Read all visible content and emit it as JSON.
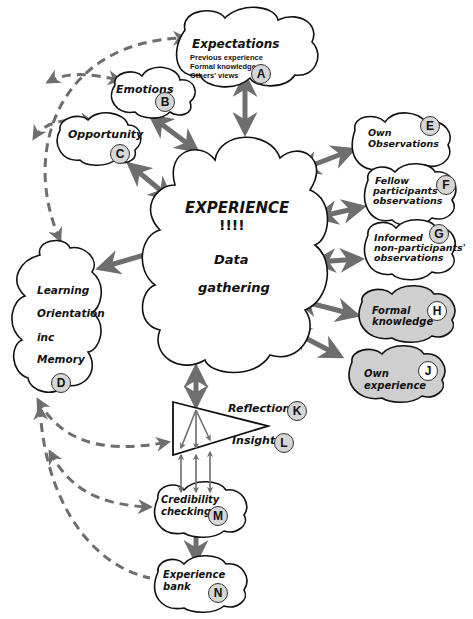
{
  "diagram": {
    "title_cut": "",
    "center": {
      "title": "EXPERIENCE",
      "exclaim": "!!!!",
      "line1": "Data",
      "line2": "gathering"
    },
    "nodes": {
      "A": {
        "badge": "A",
        "title": "Expectations",
        "lines": [
          "Previous experience",
          "Formal knowledge",
          "Others' views"
        ]
      },
      "B": {
        "badge": "B",
        "title": "Emotions"
      },
      "C": {
        "badge": "C",
        "title": "Opportunity"
      },
      "D": {
        "badge": "D",
        "lines": [
          "Learning",
          "Orientation",
          "inc",
          "Memory"
        ]
      },
      "E": {
        "badge": "E",
        "lines": [
          "Own",
          "Observations"
        ]
      },
      "F": {
        "badge": "F",
        "lines": [
          "Fellow",
          "participants",
          "observations"
        ]
      },
      "G": {
        "badge": "G",
        "lines": [
          "Informed",
          "non-participants'",
          "observations"
        ]
      },
      "H": {
        "badge": "H",
        "lines": [
          "Formal",
          "knowledge"
        ]
      },
      "J": {
        "badge": "J",
        "lines": [
          "Own",
          "experience"
        ]
      },
      "K": {
        "badge": "K",
        "title": "Reflection"
      },
      "L": {
        "badge": "L",
        "title": "Insight"
      },
      "M": {
        "badge": "M",
        "lines": [
          "Credibility",
          "checking"
        ]
      },
      "N": {
        "badge": "N",
        "lines": [
          "Experience",
          "bank"
        ]
      }
    },
    "colors": {
      "arrow": "#6e6e6e",
      "outline": "#111111",
      "badge_fill": "#d6d6d6",
      "shaded_cloud": "#cfcfcf"
    }
  }
}
